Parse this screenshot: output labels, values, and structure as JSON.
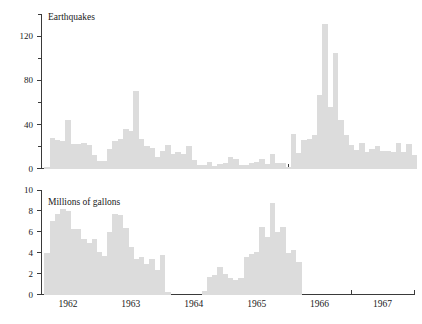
{
  "figure": {
    "width": 422,
    "height": 324,
    "background": "#ffffff",
    "bar_color": "#dcdcdc",
    "axis_color": "#3a3a3a"
  },
  "chart_data": [
    {
      "type": "bar",
      "id": "earthquakes",
      "title": "Earthquakes",
      "xlabel": "",
      "ylabel": "",
      "ylim": [
        0,
        140
      ],
      "yticks": [
        0,
        40,
        80,
        120
      ],
      "yticklabels": [
        "0",
        "40",
        "80",
        "120"
      ],
      "yminorticks": [
        20,
        60,
        100,
        140
      ],
      "grid": false,
      "legend": "none",
      "xlim": [
        1961.58,
        1967.5
      ],
      "xticks": [
        1961.5,
        1962.5,
        1963.5,
        1964.5,
        1965.5,
        1966.5,
        1967.5
      ],
      "xticklabels": [
        "1962",
        "1963",
        "1964",
        "1965",
        "1966",
        "1967"
      ],
      "bin_width_years": 0.0833,
      "x": [
        1961.625,
        1961.708,
        1961.792,
        1961.875,
        1961.958,
        1962.042,
        1962.125,
        1962.208,
        1962.292,
        1962.375,
        1962.458,
        1962.542,
        1962.625,
        1962.708,
        1962.792,
        1962.875,
        1962.958,
        1963.042,
        1963.125,
        1963.208,
        1963.292,
        1963.375,
        1963.458,
        1963.542,
        1963.625,
        1963.708,
        1963.792,
        1963.875,
        1963.958,
        1964.042,
        1964.125,
        1964.208,
        1964.292,
        1964.375,
        1964.458,
        1964.542,
        1964.625,
        1964.708,
        1964.792,
        1964.875,
        1964.958,
        1965.042,
        1965.125,
        1965.208,
        1965.292,
        1965.375,
        1965.458,
        1965.542,
        1965.625,
        1965.708,
        1965.792,
        1965.875,
        1965.958,
        1966.042,
        1966.125,
        1966.208,
        1966.292,
        1966.375,
        1966.458,
        1966.542,
        1966.625,
        1966.708,
        1966.792,
        1966.875,
        1966.958,
        1967.042,
        1967.125,
        1967.208,
        1967.292,
        1967.375,
        1967.458
      ],
      "values": [
        1,
        28,
        26,
        25,
        44,
        22,
        22,
        23,
        21,
        12,
        7,
        7,
        18,
        25,
        27,
        36,
        34,
        70,
        27,
        20,
        19,
        10,
        16,
        21,
        13,
        15,
        13,
        20,
        8,
        3,
        3,
        6,
        2,
        4,
        5,
        10,
        9,
        3,
        3,
        5,
        6,
        9,
        4,
        13,
        5,
        5,
        1,
        31,
        14,
        26,
        27,
        30,
        67,
        131,
        56,
        105,
        44,
        30,
        21,
        17,
        23,
        15,
        18,
        20,
        16,
        16,
        15,
        23,
        15,
        22,
        12
      ]
    },
    {
      "type": "bar",
      "id": "millions-of-gallons",
      "title": "Millions of gallons",
      "xlabel": "",
      "ylabel": "",
      "ylim": [
        0,
        10
      ],
      "yticks": [
        0,
        2,
        4,
        6,
        8,
        10
      ],
      "yticklabels": [
        "0",
        "2",
        "4",
        "6",
        "8",
        "10"
      ],
      "grid": false,
      "legend": "none",
      "xlim": [
        1961.58,
        1967.5
      ],
      "xticks": [
        1961.5,
        1962.5,
        1963.5,
        1964.5,
        1965.5,
        1966.5,
        1967.5
      ],
      "xticklabels": [
        "1962",
        "1963",
        "1964",
        "1965",
        "1966",
        "1967"
      ],
      "bin_width_years": 0.0833,
      "x": [
        1961.625,
        1961.708,
        1961.792,
        1961.875,
        1961.958,
        1962.042,
        1962.125,
        1962.208,
        1962.292,
        1962.375,
        1962.458,
        1962.542,
        1962.625,
        1962.708,
        1962.792,
        1962.875,
        1962.958,
        1963.042,
        1963.125,
        1963.208,
        1963.292,
        1963.375,
        1963.458,
        1963.542,
        1964.125,
        1964.208,
        1964.292,
        1964.375,
        1964.458,
        1964.542,
        1964.625,
        1964.708,
        1964.792,
        1964.875,
        1964.958,
        1965.042,
        1965.125,
        1965.208,
        1965.292,
        1965.375,
        1965.458,
        1965.542,
        1965.625
      ],
      "values": [
        4.0,
        7.0,
        7.7,
        8.2,
        8.0,
        6.3,
        6.3,
        5.3,
        4.9,
        5.3,
        4.1,
        3.7,
        6.0,
        7.7,
        7.6,
        6.4,
        4.5,
        3.4,
        3.6,
        2.9,
        3.4,
        2.3,
        3.8,
        0.2,
        0.3,
        1.7,
        1.9,
        2.6,
        2.0,
        1.6,
        1.4,
        1.6,
        3.6,
        3.9,
        4.1,
        6.5,
        5.5,
        8.8,
        6.0,
        6.5,
        4.0,
        4.3,
        3.1
      ]
    }
  ]
}
